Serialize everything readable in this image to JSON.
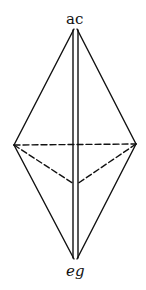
{
  "figure": {
    "type": "crystal-bipyramid-diagram",
    "labels": {
      "top_vertex": "ac",
      "bottom_vertex": "eg"
    },
    "colors": {
      "line": "#111111",
      "background": "#ffffff"
    },
    "vertices": {
      "top": [
        75,
        28
      ],
      "bottom": [
        76,
        260
      ],
      "left": [
        14,
        145
      ],
      "right": [
        136,
        144
      ],
      "back": [
        75,
        184
      ]
    }
  }
}
